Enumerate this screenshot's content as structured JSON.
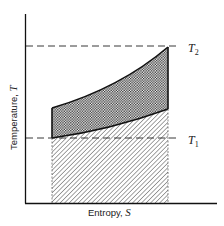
{
  "figure": {
    "x_axis_label": "Entropy, ",
    "x_axis_symbol": "S",
    "y_axis_label": "Temperature, ",
    "y_axis_symbol": "T",
    "levels": [
      {
        "name": "T",
        "subscript": "2",
        "description": "upper temperature level (dashed line)"
      },
      {
        "name": "T",
        "subscript": "1",
        "description": "lower temperature level (dashed line)"
      }
    ],
    "regions": [
      {
        "name": "cross-hatched area",
        "description": "area between upper and lower process curves"
      },
      {
        "name": "diagonal-hatched area",
        "description": "area under lower curve down to entropy axis"
      }
    ],
    "colors": {
      "ink": "#1a1a1a",
      "background": "#ffffff"
    }
  }
}
